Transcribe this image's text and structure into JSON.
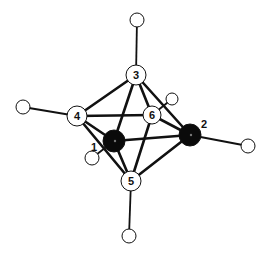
{
  "diagram": {
    "colors": {
      "line": "#111111",
      "heavy_atom": "#0a0a0a",
      "light_atom": "#ffffff"
    },
    "atoms": [
      {
        "id": "1",
        "label": "1",
        "type": "heavy",
        "x": 114,
        "y": 141,
        "r": 11,
        "label_x": 94,
        "label_y": 151
      },
      {
        "id": "2",
        "label": "2",
        "type": "heavy",
        "x": 190,
        "y": 135,
        "r": 11,
        "label_x": 204,
        "label_y": 128
      },
      {
        "id": "3",
        "label": "3",
        "type": "light",
        "x": 136,
        "y": 75,
        "r": 10
      },
      {
        "id": "4",
        "label": "4",
        "type": "light",
        "x": 77,
        "y": 116,
        "r": 10
      },
      {
        "id": "5",
        "label": "5",
        "type": "light",
        "x": 131,
        "y": 181,
        "r": 10
      },
      {
        "id": "6",
        "label": "6",
        "type": "light",
        "x": 152,
        "y": 115,
        "r": 9
      }
    ],
    "hydrogens": [
      {
        "on": "3",
        "x": 137,
        "y": 20,
        "r": 7
      },
      {
        "on": "4",
        "x": 23,
        "y": 107,
        "r": 7
      },
      {
        "on": "6",
        "x": 172,
        "y": 99,
        "r": 6
      },
      {
        "on": "1",
        "x": 92,
        "y": 158,
        "r": 7
      },
      {
        "on": "2",
        "x": 248,
        "y": 146,
        "r": 7
      },
      {
        "on": "5",
        "x": 129,
        "y": 236,
        "r": 7
      }
    ],
    "bonds": [
      [
        "3",
        "4"
      ],
      [
        "3",
        "6"
      ],
      [
        "3",
        "1"
      ],
      [
        "3",
        "2"
      ],
      [
        "4",
        "6"
      ],
      [
        "4",
        "1"
      ],
      [
        "4",
        "5"
      ],
      [
        "6",
        "2"
      ],
      [
        "6",
        "5"
      ],
      [
        "1",
        "2"
      ],
      [
        "1",
        "5"
      ],
      [
        "2",
        "5"
      ]
    ]
  }
}
